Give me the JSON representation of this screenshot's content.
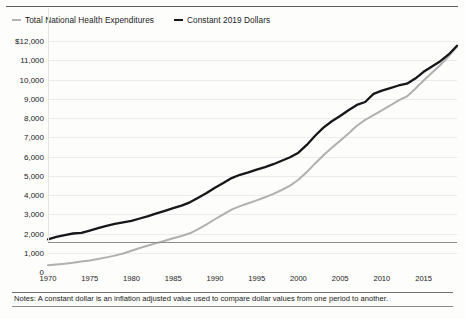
{
  "chart_data": {
    "type": "line",
    "title": "",
    "xlabel": "",
    "ylabel": "",
    "xlim": [
      1970,
      2019
    ],
    "ylim": [
      0,
      12000
    ],
    "grid": true,
    "legend_position": "top-left",
    "y_ticks": [
      "$12,000",
      "11,000",
      "10,000",
      "9,000",
      "8,000",
      "7,000",
      "6,000",
      "5,000",
      "4,000",
      "3,000",
      "2,000",
      "1,000",
      "0"
    ],
    "y_tick_values": [
      12000,
      11000,
      10000,
      9000,
      8000,
      7000,
      6000,
      5000,
      4000,
      3000,
      2000,
      1000,
      0
    ],
    "x_ticks": [
      "1970",
      "1975",
      "1980",
      "1985",
      "1990",
      "1995",
      "2000",
      "2005",
      "2010",
      "2015"
    ],
    "x_tick_values": [
      1970,
      1975,
      1980,
      1985,
      1990,
      1995,
      2000,
      2005,
      2010,
      2015
    ],
    "x": [
      1970,
      1971,
      1972,
      1973,
      1974,
      1975,
      1976,
      1977,
      1978,
      1979,
      1980,
      1981,
      1982,
      1983,
      1984,
      1985,
      1986,
      1987,
      1988,
      1989,
      1990,
      1991,
      1992,
      1993,
      1994,
      1995,
      1996,
      1997,
      1998,
      1999,
      2000,
      2001,
      2002,
      2003,
      2004,
      2005,
      2006,
      2007,
      2008,
      2009,
      2010,
      2011,
      2012,
      2013,
      2014,
      2015,
      2016,
      2017,
      2018,
      2019
    ],
    "series": [
      {
        "name": "Total National Health Expenditures",
        "color": "#b0b0b0",
        "values": [
          350,
          390,
          430,
          480,
          540,
          600,
          680,
          760,
          850,
          960,
          1100,
          1250,
          1380,
          1500,
          1620,
          1750,
          1870,
          2010,
          2230,
          2470,
          2740,
          2990,
          3240,
          3420,
          3570,
          3720,
          3880,
          4060,
          4260,
          4490,
          4790,
          5190,
          5640,
          6060,
          6450,
          6820,
          7200,
          7600,
          7900,
          8150,
          8400,
          8650,
          8920,
          9120,
          9520,
          9950,
          10350,
          10750,
          11200,
          11700
        ]
      },
      {
        "name": "Constant 2019 Dollars",
        "color": "#17171a",
        "values": [
          1700,
          1820,
          1920,
          2000,
          2030,
          2150,
          2280,
          2400,
          2500,
          2580,
          2660,
          2780,
          2900,
          3050,
          3180,
          3320,
          3450,
          3620,
          3860,
          4100,
          4380,
          4620,
          4880,
          5050,
          5180,
          5320,
          5450,
          5600,
          5780,
          5960,
          6200,
          6600,
          7080,
          7500,
          7830,
          8100,
          8400,
          8680,
          8830,
          9250,
          9420,
          9550,
          9690,
          9780,
          10050,
          10400,
          10680,
          10950,
          11300,
          11750
        ]
      }
    ]
  },
  "legend": {
    "items": [
      {
        "label": "Total National Health Expenditures"
      },
      {
        "label": "Constant 2019 Dollars"
      }
    ]
  },
  "notes": {
    "text": "Notes: A constant dollar is an inflation adjusted value used to compare dollar values from one period to another."
  },
  "colors": {
    "nominal_line": "#b0b0b0",
    "constant_line": "#17171a",
    "grid": "#ececec",
    "axis": "#8c8c8c",
    "background": "#fdfdfc"
  }
}
